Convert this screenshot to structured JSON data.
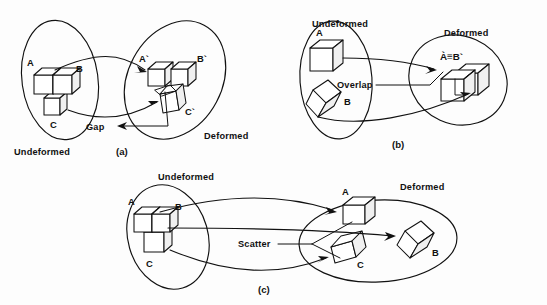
{
  "figure": {
    "background_color": "#fdfdfd",
    "ink_color": "#111111",
    "panels": [
      {
        "id": "a",
        "caption": "(a)",
        "regions": [
          {
            "name": "undeformed",
            "label": "Undeformed"
          },
          {
            "name": "deformed",
            "label": "Deformed"
          }
        ],
        "undeformed_cubes": [
          {
            "id": "A",
            "label": "A"
          },
          {
            "id": "B",
            "label": "B"
          },
          {
            "id": "C",
            "label": "C"
          }
        ],
        "deformed_cubes": [
          {
            "id": "A-prime",
            "label": "A`"
          },
          {
            "id": "B-prime",
            "label": "B`"
          },
          {
            "id": "C-prime",
            "label": "C`"
          }
        ],
        "annotation": {
          "name": "gap",
          "label": "Gap"
        }
      },
      {
        "id": "b",
        "caption": "(b)",
        "regions": [
          {
            "name": "undeformed",
            "label": "Undeformed"
          },
          {
            "name": "deformed",
            "label": "Deformed"
          }
        ],
        "undeformed_cubes": [
          {
            "id": "A",
            "label": "A"
          },
          {
            "id": "B",
            "label": "B"
          }
        ],
        "deformed_cubes": [
          {
            "id": "A-equiv-B-prime",
            "label": "À≡B`"
          }
        ],
        "annotation": {
          "name": "overlap",
          "label": "Overlap"
        }
      },
      {
        "id": "c",
        "caption": "(c)",
        "regions": [
          {
            "name": "undeformed",
            "label": "Undeformed"
          },
          {
            "name": "deformed",
            "label": "Deformed"
          }
        ],
        "undeformed_cubes": [
          {
            "id": "A",
            "label": "A"
          },
          {
            "id": "B",
            "label": "B"
          },
          {
            "id": "C",
            "label": "C"
          }
        ],
        "deformed_cubes": [
          {
            "id": "A",
            "label": "A"
          },
          {
            "id": "B",
            "label": "B"
          },
          {
            "id": "C",
            "label": "C"
          }
        ],
        "annotation": {
          "name": "scatter",
          "label": "Scatter"
        }
      }
    ]
  }
}
